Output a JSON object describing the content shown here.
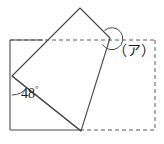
{
  "figure": {
    "known_angle_label": "48",
    "degree_symbol": "°",
    "unknown_angle_label": "（ア）",
    "stroke_color": "#4a4a4a",
    "dash_color": "#5a5a5a",
    "text_color": "#1a1a1a",
    "background_color": "#ffffff",
    "geometry": {
      "base_rectangle": {
        "top_left": [
          10,
          40
        ],
        "top_right": [
          155,
          40
        ],
        "bottom_right": [
          155,
          130
        ],
        "bottom_left": [
          10,
          130
        ]
      },
      "folded_quad": [
        [
          12,
          76
        ],
        [
          80,
          8
        ],
        [
          110,
          38
        ],
        [
          80,
          131
        ]
      ],
      "crease_line": [
        [
          12,
          76
        ],
        [
          80,
          131
        ]
      ],
      "solid_left_edge": [
        [
          10,
          40
        ],
        [
          10,
          130
        ]
      ],
      "solid_bottom_edge": [
        [
          10,
          130
        ],
        [
          80,
          131
        ]
      ],
      "solid_top_edge": [
        [
          10,
          40
        ],
        [
          42,
          40
        ]
      ],
      "angle_arc_48_center": [
        12,
        76
      ],
      "angle_arc_unknown_center": [
        110,
        38
      ]
    }
  }
}
